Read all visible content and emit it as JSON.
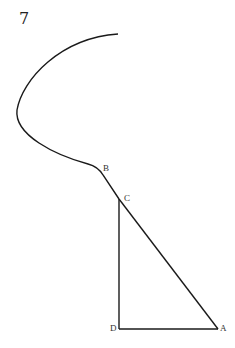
{
  "figure": {
    "number": "7",
    "points": {
      "A": {
        "label": "A",
        "x": 218,
        "y": 329
      },
      "B": {
        "label": "B",
        "x": 100,
        "y": 168
      },
      "C": {
        "label": "C",
        "x": 119,
        "y": 199
      },
      "D": {
        "label": "D",
        "x": 119,
        "y": 329
      }
    },
    "stroke_color": "#1a1a1a"
  }
}
